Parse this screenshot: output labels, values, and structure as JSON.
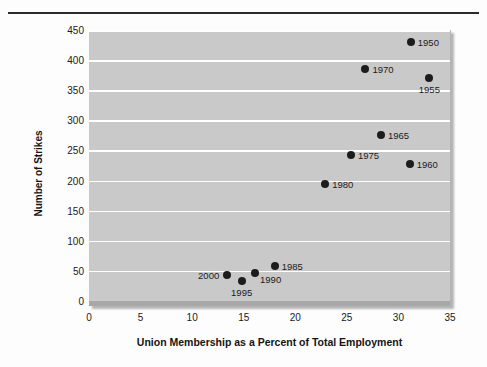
{
  "figure": {
    "background_color": "#fdfdfd",
    "plot_background_color": "#c9c9c9",
    "gridline_color": "#ffffff",
    "marker_color": "#1c1c1c"
  },
  "chart_data": {
    "type": "scatter",
    "title": "",
    "xlabel": "Union Membership as a Percent of Total Employment",
    "ylabel": "Number of Strikes",
    "xlim": [
      0,
      35
    ],
    "ylim": [
      0,
      450
    ],
    "xticks": [
      "0",
      "5",
      "10",
      "15",
      "20",
      "25",
      "30",
      "35"
    ],
    "yticks": [
      "0",
      "50",
      "100",
      "150",
      "200",
      "250",
      "300",
      "350",
      "400",
      "450"
    ],
    "grid": "horizontal",
    "legend": "none",
    "point_labels": "year",
    "points": [
      {
        "label": "1950",
        "x": 31.2,
        "y": 430,
        "label_pos": "right"
      },
      {
        "label": "1955",
        "x": 33.0,
        "y": 370,
        "label_pos": "below"
      },
      {
        "label": "1960",
        "x": 31.1,
        "y": 228,
        "label_pos": "right"
      },
      {
        "label": "1965",
        "x": 28.3,
        "y": 275,
        "label_pos": "right"
      },
      {
        "label": "1970",
        "x": 26.8,
        "y": 385,
        "label_pos": "right"
      },
      {
        "label": "1975",
        "x": 25.4,
        "y": 243,
        "label_pos": "right"
      },
      {
        "label": "1980",
        "x": 22.9,
        "y": 195,
        "label_pos": "right"
      },
      {
        "label": "1985",
        "x": 18.0,
        "y": 58,
        "label_pos": "right"
      },
      {
        "label": "1990",
        "x": 16.1,
        "y": 47,
        "label_pos": "belowright"
      },
      {
        "label": "1995",
        "x": 14.8,
        "y": 34,
        "label_pos": "below"
      },
      {
        "label": "2000",
        "x": 13.4,
        "y": 43,
        "label_pos": "left"
      }
    ]
  }
}
